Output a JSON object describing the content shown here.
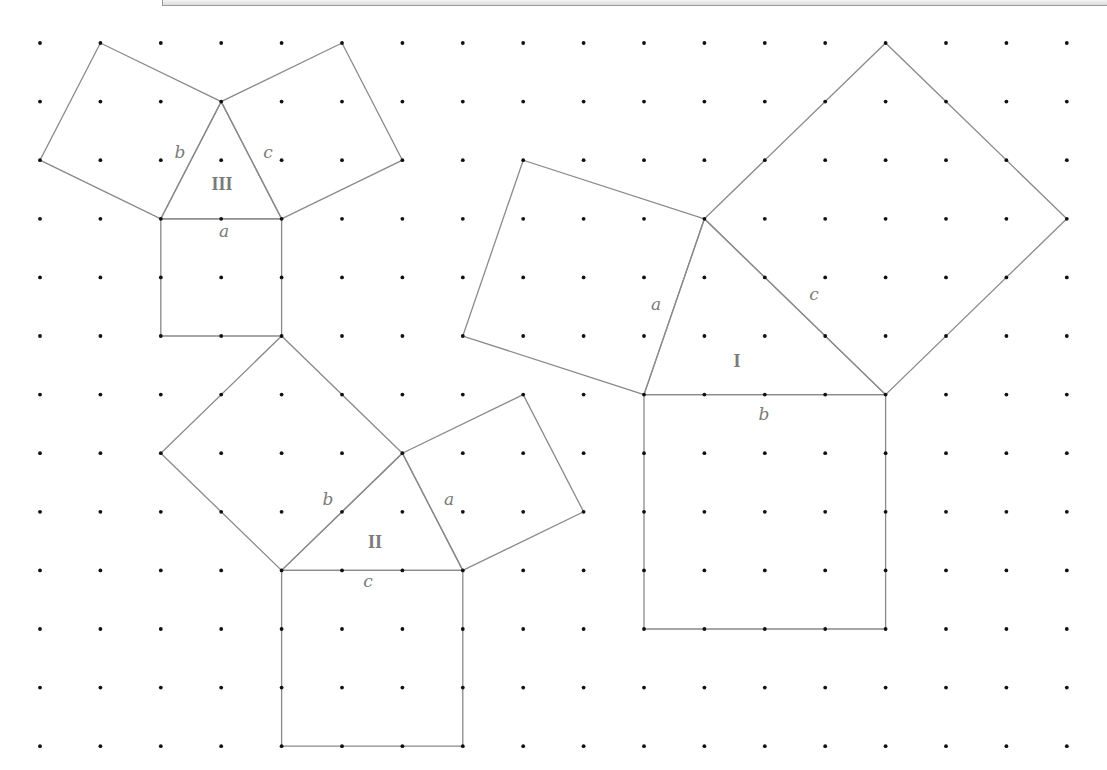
{
  "diagram": {
    "grid": {
      "cols": 18,
      "rows": 13,
      "x0": 40,
      "y0": 43,
      "dx": 60.4,
      "dy": 58.6
    },
    "figures": [
      {
        "id": "III",
        "label": "III",
        "label_pos": [
          222,
          190
        ],
        "triangle": [
          [
            2,
            3
          ],
          [
            3,
            1
          ],
          [
            4,
            3
          ]
        ],
        "squares": [
          {
            "side": "b",
            "pts": [
              [
                2,
                3
              ],
              [
                3,
                1
              ],
              [
                1,
                0
              ],
              [
                0,
                2
              ]
            ]
          },
          {
            "side": "c",
            "pts": [
              [
                3,
                1
              ],
              [
                4,
                3
              ],
              [
                6,
                2
              ],
              [
                5,
                0
              ]
            ]
          },
          {
            "side": "a",
            "pts": [
              [
                2,
                3
              ],
              [
                4,
                3
              ],
              [
                4,
                5
              ],
              [
                2,
                5
              ]
            ]
          }
        ],
        "side_labels": [
          {
            "text": "b",
            "pos": [
              180,
              158
            ]
          },
          {
            "text": "c",
            "pos": [
              268,
              158
            ]
          },
          {
            "text": "a",
            "pos": [
              224,
              237
            ]
          }
        ]
      },
      {
        "id": "II",
        "label": "II",
        "label_pos": [
          375,
          548
        ],
        "triangle": [
          [
            4,
            9
          ],
          [
            6,
            7
          ],
          [
            7,
            9
          ]
        ],
        "squares": [
          {
            "side": "b",
            "pts": [
              [
                4,
                9
              ],
              [
                6,
                7
              ],
              [
                4,
                5
              ],
              [
                2,
                7
              ]
            ]
          },
          {
            "side": "a",
            "pts": [
              [
                6,
                7
              ],
              [
                7,
                9
              ],
              [
                9,
                8
              ],
              [
                8,
                6
              ]
            ]
          },
          {
            "side": "c",
            "pts": [
              [
                4,
                9
              ],
              [
                7,
                9
              ],
              [
                7,
                12
              ],
              [
                4,
                12
              ]
            ]
          }
        ],
        "side_labels": [
          {
            "text": "b",
            "pos": [
              328,
              505
            ]
          },
          {
            "text": "a",
            "pos": [
              449,
              505
            ]
          },
          {
            "text": "c",
            "pos": [
              368,
              587
            ]
          }
        ]
      },
      {
        "id": "I",
        "label": "I",
        "label_pos": [
          737,
          367
        ],
        "triangle": [
          [
            10,
            6
          ],
          [
            11,
            3
          ],
          [
            14,
            6
          ]
        ],
        "squares": [
          {
            "side": "a",
            "pts": [
              [
                10,
                6
              ],
              [
                11,
                3
              ],
              [
                8,
                2
              ],
              [
                7,
                5
              ]
            ]
          },
          {
            "side": "c",
            "pts": [
              [
                11,
                3
              ],
              [
                14,
                6
              ],
              [
                17,
                3
              ],
              [
                14,
                0
              ]
            ]
          },
          {
            "side": "b",
            "pts": [
              [
                10,
                6
              ],
              [
                14,
                6
              ],
              [
                14,
                10
              ],
              [
                10,
                10
              ]
            ]
          }
        ],
        "side_labels": [
          {
            "text": "a",
            "pos": [
              656,
              310
            ]
          },
          {
            "text": "c",
            "pos": [
              814,
              300
            ]
          },
          {
            "text": "b",
            "pos": [
              764,
              420
            ]
          }
        ]
      }
    ]
  }
}
